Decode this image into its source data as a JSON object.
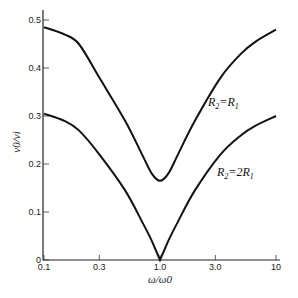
{
  "chart_data": {
    "type": "line",
    "title": "",
    "xlabel": "ω/ω0",
    "ylabel": "v0/vi",
    "xscale": "log",
    "xlim": [
      0.1,
      10
    ],
    "ylim": [
      0,
      0.5
    ],
    "grid": false,
    "legend": "inline labels on curves",
    "x_ticks": [
      "0.1",
      "0.3",
      "1.0",
      "3.0",
      "10"
    ],
    "y_ticks": [
      "0",
      "0.1",
      "0.2",
      "0.3",
      "0.4",
      "0.5"
    ],
    "x": [
      0.1,
      0.15,
      0.2,
      0.3,
      0.5,
      0.7,
      0.85,
      1.0,
      1.18,
      1.43,
      2.0,
      3.33,
      5.0,
      6.67,
      10
    ],
    "series": [
      {
        "name": "R2=R1",
        "label_main": "R",
        "label_sub1": "2",
        "label_eq": "=R",
        "label_sub2": "1",
        "values": [
          0.485,
          0.47,
          0.45,
          0.38,
          0.29,
          0.22,
          0.18,
          0.165,
          0.18,
          0.22,
          0.29,
          0.38,
          0.43,
          0.455,
          0.48
        ]
      },
      {
        "name": "R2=2R1",
        "label_main": "R",
        "label_sub1": "2",
        "label_eq": "=2R",
        "label_sub2": "1",
        "values": [
          0.305,
          0.29,
          0.27,
          0.22,
          0.145,
          0.08,
          0.04,
          0.0,
          0.04,
          0.08,
          0.145,
          0.22,
          0.26,
          0.28,
          0.3
        ]
      }
    ]
  }
}
